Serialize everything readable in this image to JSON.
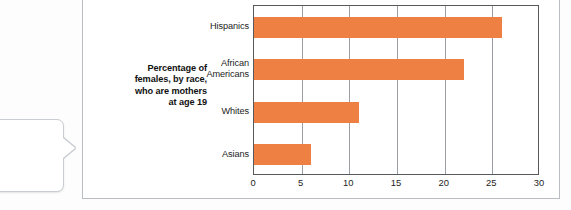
{
  "callout": {
    "lines": [
      {
        "text": "regnancy",
        "bold": true
      },
      {
        "text": "erican teen-",
        "bold": false
      },
      {
        "text": "nt differs",
        "bold": false
      },
      {
        "text": "bcultures",
        "bold": false
      },
      {
        "text": "2009].",
        "bold": false
      }
    ]
  },
  "chart_data": {
    "type": "bar",
    "orientation": "horizontal",
    "title": "",
    "ylabel": "Percentage of females, by race, who are mothers at age 19",
    "ylabel_lines": [
      "Percentage of",
      "females, by race,",
      "who are mothers",
      "at age 19"
    ],
    "xlabel": "",
    "categories": [
      "Hispanics",
      "African Americans",
      "Whites",
      "Asians"
    ],
    "category_lines": [
      [
        "Hispanics"
      ],
      [
        "African",
        "Americans"
      ],
      [
        "Whites"
      ],
      [
        "Asians"
      ]
    ],
    "values": [
      26,
      22,
      11,
      6
    ],
    "xlim": [
      0,
      30
    ],
    "xticks": [
      0,
      5,
      10,
      15,
      20,
      25,
      30
    ],
    "xtick_labels": [
      "0",
      "5",
      "10",
      "15",
      "20",
      "25",
      "30"
    ],
    "grid": "vertical",
    "legend": "none",
    "bar_color": "#ee8043",
    "axis_color": "#58595b",
    "gridline_color": "#9a9da2"
  }
}
